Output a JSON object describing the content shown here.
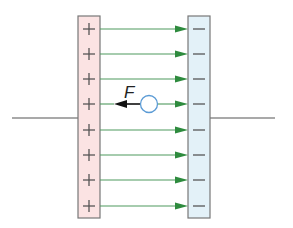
{
  "diagram": {
    "force_label": "F",
    "positive_plate": {
      "sign": "+",
      "count": 8,
      "fill": "#fbe3e3",
      "stroke": "#777777"
    },
    "negative_plate": {
      "sign": "−",
      "count": 8,
      "fill": "#e3f1f8",
      "stroke": "#777777"
    },
    "field_lines": {
      "count": 8,
      "color": "#4f9a5e",
      "arrowhead_color": "#2e8b3e",
      "direction": "left-to-right"
    },
    "charge": {
      "shape": "circle",
      "stroke": "#5b9bd5",
      "fill": "#ffffff"
    },
    "force_arrow": {
      "color": "#111111",
      "direction": "left"
    },
    "wire_color": "#555555",
    "row_y": [
      29,
      54,
      79,
      104,
      130,
      155,
      180,
      206
    ]
  }
}
